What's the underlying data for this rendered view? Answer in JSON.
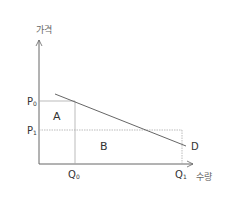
{
  "diagram": {
    "type": "demand-curve",
    "y_axis_label": "가격",
    "x_axis_label": "수량",
    "price_labels": {
      "p0": "P",
      "p0_sub": "0",
      "p1": "P",
      "p1_sub": "1"
    },
    "quantity_labels": {
      "q0": "Q",
      "q0_sub": "0",
      "q1": "Q",
      "q1_sub": "1"
    },
    "curve_label": "D",
    "region_labels": {
      "a": "A",
      "b": "B"
    },
    "colors": {
      "axis": "#555555",
      "curve": "#555555",
      "guide": "#aaaaaa",
      "text": "#333333"
    }
  }
}
